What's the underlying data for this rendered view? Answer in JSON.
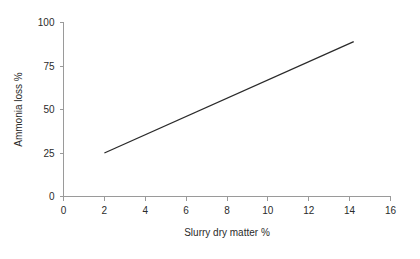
{
  "chart_data": {
    "type": "line",
    "title": "",
    "subtitle": "",
    "xlabel": "Slurry dry matter %",
    "ylabel": "Ammonia loss %",
    "xlim": [
      0,
      16
    ],
    "ylim": [
      0,
      100
    ],
    "xticks": [
      0,
      2,
      4,
      6,
      8,
      10,
      12,
      14,
      16
    ],
    "xtick_labels": [
      "0",
      "2",
      "4",
      "6",
      "8",
      "10",
      "12",
      "14",
      "16"
    ],
    "yticks": [
      0,
      25,
      50,
      75,
      100
    ],
    "ytick_labels": [
      "0",
      "25",
      "50",
      "75",
      "100"
    ],
    "grid": false,
    "legend": false,
    "legend_position": "none",
    "series": [
      {
        "name": "Ammonia loss",
        "color": "#2a2a2a",
        "x": [
          2,
          14.2
        ],
        "values": [
          25,
          89
        ]
      }
    ],
    "annotations": []
  },
  "axes": {
    "x_axis_name": "x-axis",
    "y_axis_name": "y-axis"
  }
}
